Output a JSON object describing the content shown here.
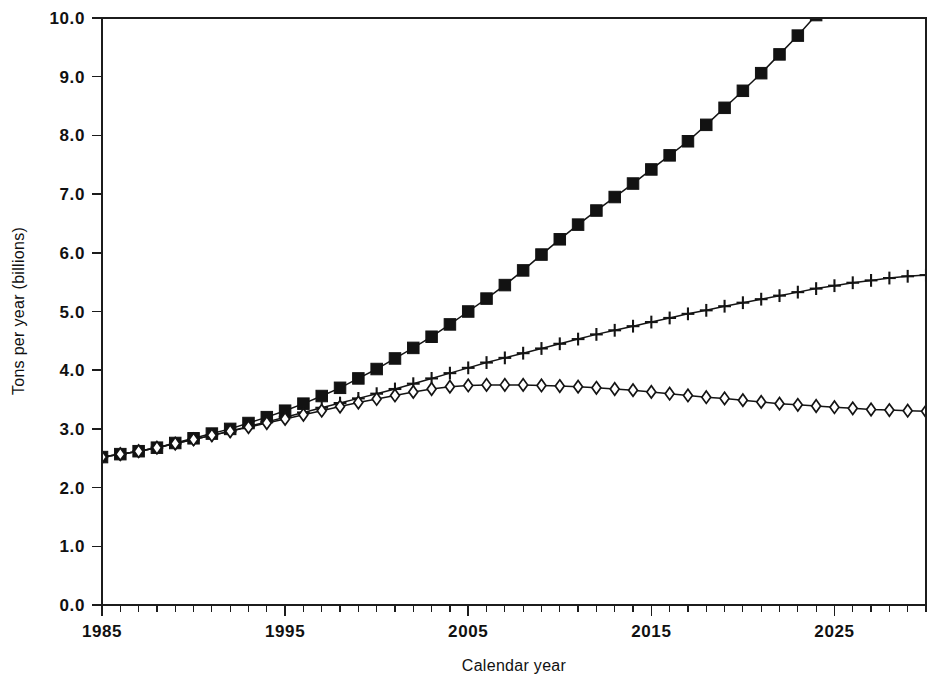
{
  "figure": {
    "background_color": "#ffffff",
    "ink_color": "#141414"
  },
  "chart_data": {
    "type": "line",
    "title": "",
    "subtitle": "",
    "xlabel": "Calendar year",
    "ylabel": "Tons per year (billions)",
    "xlim": [
      1985,
      2030
    ],
    "ylim": [
      0.0,
      10.0
    ],
    "grid": false,
    "legend_position": "none",
    "x_major_ticks": [
      1985,
      1995,
      2005,
      2015,
      2025
    ],
    "x_major_tick_labels": [
      "1985",
      "1995",
      "2005",
      "2015",
      "2025"
    ],
    "x_minor_tick_step": 1,
    "y_major_ticks": [
      0.0,
      1.0,
      2.0,
      3.0,
      4.0,
      5.0,
      6.0,
      7.0,
      8.0,
      9.0,
      10.0
    ],
    "y_major_tick_labels": [
      "0.0",
      "1.0",
      "2.0",
      "3.0",
      "4.0",
      "5.0",
      "6.0",
      "7.0",
      "8.0",
      "9.0",
      "10.0"
    ],
    "x": [
      1985,
      1986,
      1987,
      1988,
      1989,
      1990,
      1991,
      1992,
      1993,
      1994,
      1995,
      1996,
      1997,
      1998,
      1999,
      2000,
      2001,
      2002,
      2003,
      2004,
      2005,
      2006,
      2007,
      2008,
      2009,
      2010,
      2011,
      2012,
      2013,
      2014,
      2015,
      2016,
      2017,
      2018,
      2019,
      2020,
      2021,
      2022,
      2023,
      2024,
      2025,
      2026,
      2027,
      2028,
      2029,
      2030
    ],
    "series": [
      {
        "name": "high-growth-scenario",
        "marker": "filled-square",
        "marker_style": "square",
        "clipped_at_top": true,
        "values": [
          2.52,
          2.57,
          2.62,
          2.68,
          2.76,
          2.84,
          2.92,
          3.0,
          3.1,
          3.2,
          3.31,
          3.43,
          3.56,
          3.7,
          3.86,
          4.02,
          4.2,
          4.38,
          4.57,
          4.78,
          5.0,
          5.22,
          5.45,
          5.7,
          5.97,
          6.23,
          6.48,
          6.72,
          6.95,
          7.18,
          7.42,
          7.66,
          7.9,
          8.18,
          8.47,
          8.76,
          9.06,
          9.38,
          9.7,
          10.05,
          10.4,
          10.76,
          11.13,
          11.51,
          11.9,
          12.3
        ]
      },
      {
        "name": "mid-growth-scenario",
        "marker": "plus",
        "marker_style": "plus",
        "clipped_at_top": false,
        "values": [
          2.52,
          2.57,
          2.62,
          2.68,
          2.75,
          2.82,
          2.89,
          2.96,
          3.04,
          3.12,
          3.2,
          3.28,
          3.36,
          3.44,
          3.52,
          3.6,
          3.68,
          3.77,
          3.86,
          3.95,
          4.04,
          4.13,
          4.21,
          4.29,
          4.37,
          4.45,
          4.53,
          4.61,
          4.68,
          4.75,
          4.82,
          4.89,
          4.96,
          5.02,
          5.09,
          5.15,
          5.21,
          5.27,
          5.33,
          5.39,
          5.44,
          5.49,
          5.53,
          5.57,
          5.6,
          5.62
        ]
      },
      {
        "name": "low-growth-scenario",
        "marker": "open-diamond",
        "marker_style": "diamond",
        "clipped_at_top": false,
        "values": [
          2.52,
          2.57,
          2.62,
          2.68,
          2.75,
          2.82,
          2.89,
          2.96,
          3.03,
          3.1,
          3.17,
          3.24,
          3.31,
          3.38,
          3.45,
          3.51,
          3.57,
          3.63,
          3.68,
          3.72,
          3.74,
          3.75,
          3.75,
          3.75,
          3.74,
          3.73,
          3.72,
          3.7,
          3.68,
          3.66,
          3.63,
          3.6,
          3.57,
          3.54,
          3.52,
          3.49,
          3.46,
          3.43,
          3.41,
          3.39,
          3.37,
          3.35,
          3.33,
          3.32,
          3.31,
          3.3
        ]
      }
    ]
  }
}
